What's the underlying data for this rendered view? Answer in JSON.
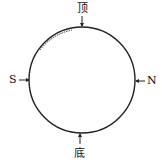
{
  "diagram": {
    "labels": {
      "top": "顶",
      "bottom": "底",
      "left": "S",
      "right": "N"
    },
    "circle": {
      "cx": 82,
      "cy": 80,
      "r": 53
    },
    "stroke_color": "#222222"
  }
}
